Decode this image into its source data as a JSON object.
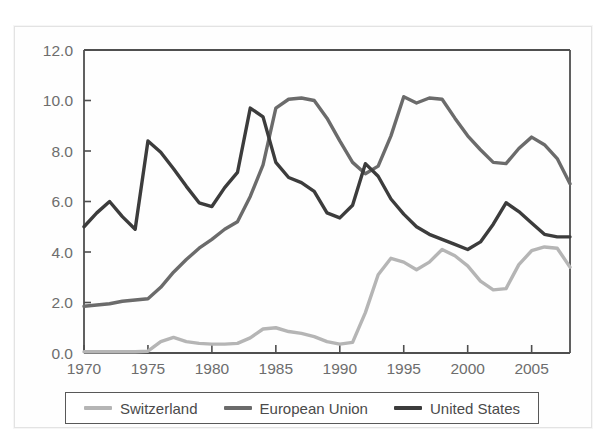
{
  "figure": {
    "background": "#ffffff",
    "frame_color": "#e3e3e3"
  },
  "legend": {
    "position": "below-axes",
    "border_color": "#585858",
    "items": [
      {
        "label": "Switzerland",
        "color": "#b5b5b5"
      },
      {
        "label": "European Union",
        "color": "#6b6b6b"
      },
      {
        "label": "United States",
        "color": "#3c3c3c"
      }
    ]
  },
  "axis": {
    "y_ticks": [
      "0.0",
      "2.0",
      "4.0",
      "6.0",
      "8.0",
      "10.0",
      "12.0"
    ],
    "x_ticks": [
      "1970",
      "1975",
      "1980",
      "1985",
      "1990",
      "1995",
      "2000",
      "2005"
    ],
    "tick_color": "#6d6d6d",
    "spine_color": "#4f4f4f"
  },
  "chart_data": {
    "type": "line",
    "title": "",
    "subtitle": "",
    "xlabel": "",
    "ylabel": "",
    "xlim": [
      1970,
      2008
    ],
    "ylim": [
      0.0,
      12.0
    ],
    "ytick_values": [
      0.0,
      2.0,
      4.0,
      6.0,
      8.0,
      10.0,
      12.0
    ],
    "xtick_values": [
      1970,
      1975,
      1980,
      1985,
      1990,
      1995,
      2000,
      2005
    ],
    "grid": false,
    "legend_position": "bottom",
    "x": [
      1970,
      1971,
      1972,
      1973,
      1974,
      1975,
      1976,
      1977,
      1978,
      1979,
      1980,
      1981,
      1982,
      1983,
      1984,
      1985,
      1986,
      1987,
      1988,
      1989,
      1990,
      1991,
      1992,
      1993,
      1994,
      1995,
      1996,
      1997,
      1998,
      1999,
      2000,
      2001,
      2002,
      2003,
      2004,
      2005,
      2006,
      2007,
      2008
    ],
    "series": [
      {
        "name": "Switzerland",
        "color": "#b5b5b5",
        "values": [
          0.05,
          0.05,
          0.05,
          0.05,
          0.05,
          0.07,
          0.45,
          0.62,
          0.45,
          0.38,
          0.35,
          0.35,
          0.38,
          0.6,
          0.95,
          1.0,
          0.85,
          0.78,
          0.65,
          0.45,
          0.35,
          0.42,
          1.6,
          3.1,
          3.75,
          3.6,
          3.3,
          3.6,
          4.1,
          3.85,
          3.45,
          2.85,
          2.5,
          2.55,
          3.5,
          4.05,
          4.2,
          4.15,
          3.4
        ]
      },
      {
        "name": "European Union",
        "color": "#6b6b6b",
        "values": [
          1.85,
          1.9,
          1.95,
          2.05,
          2.1,
          2.15,
          2.6,
          3.2,
          3.7,
          4.15,
          4.5,
          4.9,
          5.2,
          6.2,
          7.45,
          9.7,
          10.05,
          10.1,
          10.0,
          9.3,
          8.4,
          7.55,
          7.1,
          7.4,
          8.6,
          10.15,
          9.9,
          10.1,
          10.05,
          9.3,
          8.6,
          8.05,
          7.55,
          7.5,
          8.1,
          8.55,
          8.25,
          7.7,
          6.7
        ]
      },
      {
        "name": "United States",
        "color": "#3c3c3c",
        "values": [
          5.0,
          5.55,
          6.0,
          5.4,
          4.9,
          8.4,
          7.95,
          7.3,
          6.6,
          5.95,
          5.8,
          6.55,
          7.15,
          9.7,
          9.35,
          7.55,
          6.95,
          6.75,
          6.4,
          5.55,
          5.35,
          5.85,
          7.5,
          7.0,
          6.1,
          5.5,
          5.0,
          4.7,
          4.5,
          4.3,
          4.1,
          4.4,
          5.1,
          5.95,
          5.6,
          5.15,
          4.7,
          4.6,
          4.6
        ]
      }
    ]
  }
}
